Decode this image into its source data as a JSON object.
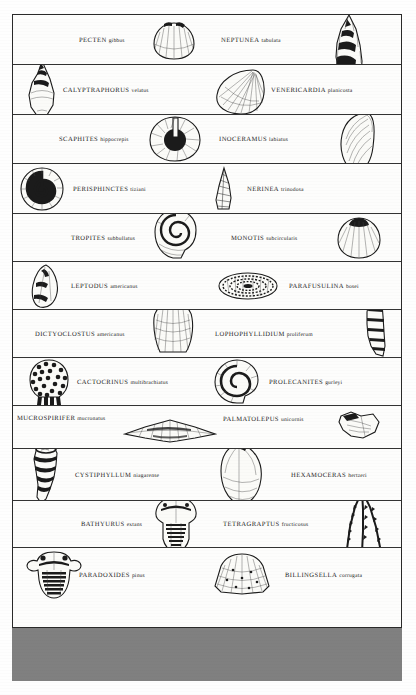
{
  "document": {
    "type": "index-fossil-chart",
    "frame": {
      "border_color": "#2a2a2a"
    },
    "bottom_block": {
      "color": "#808080",
      "label": ""
    }
  },
  "rows": [
    {
      "left": {
        "genus": "PECTEN",
        "species": "gibbus",
        "icon": "scallop-shell-icon"
      },
      "right": {
        "genus": "NEPTUNEA",
        "species": "tabulata",
        "icon": "spiral-snail-shell-icon"
      }
    },
    {
      "left": {
        "genus": "CALYPTRAPHORUS",
        "species": "velatus",
        "icon": "spindle-shell-icon"
      },
      "right": {
        "genus": "VENERICARDIA",
        "species": "planicosta",
        "icon": "ribbed-clam-icon"
      }
    },
    {
      "left": {
        "genus": "SCAPHITES",
        "species": "hippocrepis",
        "icon": "ammonite-coil-icon"
      },
      "right": {
        "genus": "INOCERAMUS",
        "species": "labiatus",
        "icon": "elongated-bivalve-icon"
      }
    },
    {
      "left": {
        "genus": "PERISPHINCTES",
        "species": "tiziani",
        "icon": "ammonite-spiral-icon"
      },
      "right": {
        "genus": "NERINEA",
        "species": "trinodosa",
        "icon": "conical-gastropod-icon"
      }
    },
    {
      "left": {
        "genus": "TROPITES",
        "species": "subbullatus",
        "icon": "coiled-ammonite-icon"
      },
      "right": {
        "genus": "MONOTIS",
        "species": "subcircularis",
        "icon": "round-bivalve-icon"
      }
    },
    {
      "left": {
        "genus": "LEPTODUS",
        "species": "americanus",
        "icon": "teardrop-brachiopod-icon"
      },
      "right": {
        "genus": "PARAFUSULINA",
        "species": "bosei",
        "icon": "fusulinid-grain-icon"
      }
    },
    {
      "left": {
        "genus": "DICTYOCLOSTUS",
        "species": "americanus",
        "icon": "productid-brachiopod-icon"
      },
      "right": {
        "genus": "LOPHOPHYLLIDIUM",
        "species": "proliferum",
        "icon": "horn-coral-icon"
      }
    },
    {
      "left": {
        "genus": "CACTOCRINUS",
        "species": "multibrachiatus",
        "icon": "crinoid-calyx-icon"
      },
      "right": {
        "genus": "PROLECANITES",
        "species": "gurleyi",
        "icon": "goniatite-spiral-icon"
      }
    },
    {
      "left": {
        "genus": "MUCROSPIRIFER",
        "species": "mucronatus",
        "icon": "winged-spirifer-icon"
      },
      "right": {
        "genus": "PALMATOLEPUS",
        "species": "unicornis",
        "icon": "conodont-platform-icon"
      }
    },
    {
      "left": {
        "genus": "CYSTIPHYLLUM",
        "species": "niagarense",
        "icon": "rugose-coral-icon"
      },
      "right": {
        "genus": "HEXAMOCERAS",
        "species": "hertzeri",
        "icon": "nautiloid-shell-icon"
      }
    },
    {
      "left": {
        "genus": "BATHYURUS",
        "species": "extans",
        "icon": "trilobite-icon"
      },
      "right": {
        "genus": "TETRAGRAPTUS",
        "species": "fructicosus",
        "icon": "graptolite-icon"
      }
    },
    {
      "left": {
        "genus": "PARADOXIDES",
        "species": "pinus",
        "icon": "large-trilobite-icon"
      },
      "right": {
        "genus": "BILLINGSELLA",
        "species": "corrugata",
        "icon": "fan-brachiopod-icon"
      }
    }
  ]
}
